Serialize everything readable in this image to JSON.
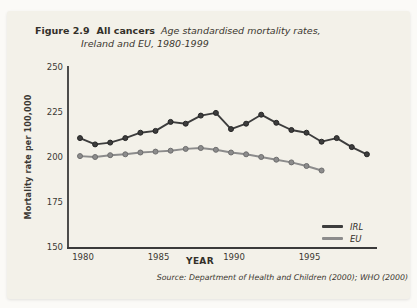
{
  "figure": {
    "label": "Figure 2.9",
    "title": "All cancers",
    "subtitle_line1": "Age standardised mortality rates,",
    "subtitle_line2": "Ireland and EU, 1980-1999",
    "source": "Source: Department of Health and Children (2000); WHO (2000)"
  },
  "chart_data": {
    "type": "line",
    "xlabel": "YEAR",
    "ylabel": "Mortality rate per 100,000",
    "ylim": [
      150,
      250
    ],
    "yticks": [
      250,
      225,
      200,
      175,
      150
    ],
    "xticks": [
      1980,
      1985,
      1990,
      1995
    ],
    "grid": false,
    "legend_position": "lower right",
    "x": [
      1980,
      1981,
      1982,
      1983,
      1984,
      1985,
      1986,
      1987,
      1988,
      1989,
      1990,
      1991,
      1992,
      1993,
      1994,
      1995,
      1996,
      1997,
      1998,
      1999
    ],
    "series": [
      {
        "name": "IRL",
        "color": "#3d3d3d",
        "marker_stroke": "#262626",
        "values": [
          210.5,
          207,
          208,
          210.5,
          213.5,
          214.5,
          219.5,
          218.5,
          223,
          224.5,
          215.5,
          218.5,
          223.5,
          219,
          215,
          213.5,
          208.5,
          210.5,
          205.5,
          201.5
        ]
      },
      {
        "name": "EU",
        "color": "#8c8c8c",
        "marker_stroke": "#6e6e6e",
        "values": [
          200.5,
          200,
          201,
          201.5,
          202.5,
          203,
          203.5,
          204.5,
          205,
          204,
          202.5,
          201.5,
          200,
          198.5,
          197,
          195,
          192.5,
          null,
          null,
          null
        ]
      }
    ]
  },
  "colors": {
    "axis": "#3a3a3a",
    "tick_text": "#3b3833",
    "card_background": "#f3f1e9"
  }
}
